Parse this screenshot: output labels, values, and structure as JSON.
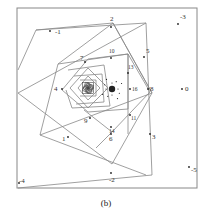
{
  "caption": "(b)",
  "frame": {
    "x": 17,
    "y": 8,
    "w": 180,
    "h": 180,
    "stroke": "#888888"
  },
  "polygons": [
    {
      "points": "18,70 36,30 146,23 152,175 18,188",
      "stroke": "#888"
    },
    {
      "points": "36,30 113,23 152,93 112,164 18,93",
      "stroke": "#888"
    },
    {
      "points": "113,23 152,93 40,135 146,175",
      "stroke": "#888"
    },
    {
      "points": "40,135 58,64 113,23",
      "stroke": "#888"
    },
    {
      "points": "58,64 128,54 150,92 112,132 84,110",
      "stroke": "#888"
    },
    {
      "points": "62,90 88,59 128,54",
      "stroke": "#888"
    },
    {
      "points": "62,90 88,112 128,109 128,54",
      "stroke": "#888"
    },
    {
      "points": "68,70 104,65 110,106 72,108 66,90",
      "stroke": "#888"
    },
    {
      "points": "70,88 88,68 108,88 88,108 70,88",
      "stroke": "#888"
    },
    {
      "points": "74,76 102,74 104,102 76,104",
      "stroke": "#888"
    },
    {
      "points": "78,88 88,76 100,88 88,100 78,88",
      "stroke": "#888"
    },
    {
      "points": "80,80 96,80 96,96 80,96",
      "stroke": "#888"
    },
    {
      "points": "83,88 88,82 94,88 88,94 83,88",
      "stroke": "#888"
    },
    {
      "points": "85,85 92,85 92,92 85,92",
      "stroke": "#888"
    },
    {
      "points": "128,54 128,134",
      "stroke": "#888"
    },
    {
      "points": "112,132 96,148",
      "stroke": "#888"
    },
    {
      "points": "146,23 18,93",
      "stroke": "#888"
    }
  ],
  "labels": [
    {
      "text": "-1",
      "x": 50,
      "y": 31,
      "dx": 5,
      "dy": 3
    },
    {
      "text": "2",
      "x": 111,
      "y": 27,
      "dx": -1,
      "dy": -6
    },
    {
      "text": "-3",
      "x": 178,
      "y": 24,
      "dx": 2,
      "dy": -5
    },
    {
      "text": "5",
      "x": 144,
      "y": 57,
      "dx": 2,
      "dy": -4
    },
    {
      "text": "7",
      "x": 85,
      "y": 62,
      "dx": -5,
      "dy": -2
    },
    {
      "text": "10",
      "x": 111,
      "y": 58,
      "dx": -2,
      "dy": -5
    },
    {
      "text": "13",
      "x": 128,
      "y": 73,
      "dx": 0,
      "dy": -4
    },
    {
      "text": "4",
      "x": 62,
      "y": 89,
      "dx": -8,
      "dy": 2
    },
    {
      "text": "8",
      "x": 148,
      "y": 89,
      "dx": 2,
      "dy": 2
    },
    {
      "text": "0",
      "x": 182,
      "y": 89,
      "dx": 3,
      "dy": 2
    },
    {
      "text": "16",
      "x": 130,
      "y": 89,
      "dx": 2,
      "dy": 2
    },
    {
      "text": "9",
      "x": 90,
      "y": 118,
      "dx": -6,
      "dy": 5
    },
    {
      "text": "14",
      "x": 111,
      "y": 127,
      "dx": -2,
      "dy": 6
    },
    {
      "text": "11",
      "x": 130,
      "y": 115,
      "dx": 1,
      "dy": 5
    },
    {
      "text": "6",
      "x": 111,
      "y": 134,
      "dx": -2,
      "dy": 7
    },
    {
      "text": "1",
      "x": 68,
      "y": 137,
      "dx": -6,
      "dy": 4
    },
    {
      "text": "3",
      "x": 150,
      "y": 134,
      "dx": 2,
      "dy": 5
    },
    {
      "text": "-2",
      "x": 111,
      "y": 173,
      "dx": -2,
      "dy": 9
    },
    {
      "text": "-5",
      "x": 189,
      "y": 167,
      "dx": 2,
      "dy": 5
    },
    {
      "text": "-4",
      "x": 19,
      "y": 183,
      "dx": 0,
      "dy": 0
    }
  ],
  "dense_cluster": {
    "x": 112,
    "y": 89,
    "r": 3.2,
    "color": "#222222"
  },
  "spiral_center": {
    "x": 88,
    "y": 88,
    "color": "#444444"
  }
}
